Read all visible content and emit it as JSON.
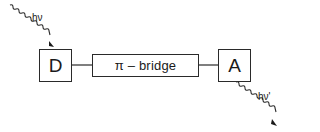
{
  "diagram": {
    "donor": {
      "label": "D"
    },
    "bridge": {
      "label": "π – bridge"
    },
    "acceptor": {
      "label": "A"
    },
    "incoming_photon": {
      "label": "hν"
    },
    "outgoing_photon": {
      "label": "hν'"
    }
  },
  "colors": {
    "stroke": "#2a2a2a",
    "background": "#ffffff"
  }
}
